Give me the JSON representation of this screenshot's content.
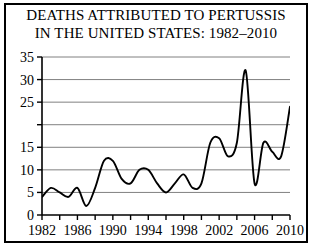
{
  "figure": {
    "title_line_1": "DEATHS ATTRIBUTED TO PERTUSSIS",
    "title_line_2": "IN THE UNITED STATES: 1982–2010",
    "border_color": "#000000",
    "background_color": "#ffffff"
  },
  "chart_data": {
    "type": "line",
    "title": "DEATHS ATTRIBUTED TO PERTUSSIS IN THE UNITED STATES: 1982–2010",
    "xlabel": "",
    "ylabel": "",
    "xlim": [
      1982,
      2010
    ],
    "ylim": [
      0,
      35
    ],
    "grid": true,
    "grid_axis": "y",
    "grid_color": "#808080",
    "line_color": "#000000",
    "legend": "none",
    "y_ticks": [
      0,
      5,
      10,
      15,
      20,
      25,
      30,
      35
    ],
    "y_tick_labels": [
      "0",
      "5",
      "10",
      "15",
      "",
      "25",
      "30",
      "35"
    ],
    "y_tick_labels_note": "The 20 label is absent in the printed original; its gridline is drawn.",
    "x_ticks": [
      1982,
      1984,
      1986,
      1988,
      1990,
      1992,
      1994,
      1996,
      1998,
      2000,
      2002,
      2004,
      2006,
      2008,
      2010
    ],
    "x_tick_labels": [
      "1982",
      "",
      "1986",
      "",
      "1990",
      "",
      "1994",
      "",
      "1998",
      "",
      "2002",
      "",
      "2006",
      "",
      "2010"
    ],
    "x_major_labels": [
      "1982",
      "1986",
      "1990",
      "1994",
      "1998",
      "2002",
      "2006",
      "2010"
    ],
    "x": [
      1982,
      1983,
      1984,
      1985,
      1986,
      1987,
      1988,
      1989,
      1990,
      1991,
      1992,
      1993,
      1994,
      1995,
      1996,
      1997,
      1998,
      1999,
      2000,
      2001,
      2002,
      2003,
      2004,
      2005,
      2006,
      2007,
      2008,
      2009,
      2010
    ],
    "values": [
      4,
      6,
      5,
      4,
      6,
      2,
      6,
      12,
      12,
      8,
      7,
      10,
      10,
      7,
      5,
      7,
      9,
      6,
      7,
      16,
      17,
      13,
      16,
      32,
      7,
      16,
      14,
      13,
      24
    ],
    "series": [
      {
        "name": "Deaths attributed to pertussis",
        "values": [
          4,
          6,
          5,
          4,
          6,
          2,
          6,
          12,
          12,
          8,
          7,
          10,
          10,
          7,
          5,
          7,
          9,
          6,
          7,
          16,
          17,
          13,
          16,
          32,
          7,
          16,
          14,
          13,
          24
        ]
      }
    ],
    "annotations": []
  }
}
